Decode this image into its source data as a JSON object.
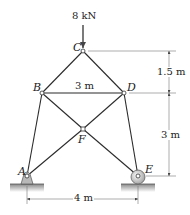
{
  "diagram": {
    "type": "truss",
    "load": {
      "label": "8 kN",
      "at_node": "C",
      "direction": "down"
    },
    "nodes": [
      {
        "id": "A",
        "label": "A",
        "x": 27,
        "y": 176,
        "support": "pin"
      },
      {
        "id": "B",
        "label": "B",
        "x": 42,
        "y": 93
      },
      {
        "id": "C",
        "label": "C",
        "x": 83,
        "y": 51
      },
      {
        "id": "D",
        "label": "D",
        "x": 124,
        "y": 93
      },
      {
        "id": "E",
        "label": "E",
        "x": 138,
        "y": 176,
        "support": "roller"
      },
      {
        "id": "F",
        "label": "F",
        "x": 83,
        "y": 129
      }
    ],
    "members": [
      [
        "A",
        "B"
      ],
      [
        "B",
        "C"
      ],
      [
        "C",
        "D"
      ],
      [
        "B",
        "D"
      ],
      [
        "D",
        "E"
      ],
      [
        "A",
        "F"
      ],
      [
        "F",
        "D"
      ],
      [
        "B",
        "F"
      ],
      [
        "F",
        "E"
      ]
    ],
    "dimensions": {
      "bd_width": "3 m",
      "upper_height": "1.5 m",
      "lower_height": "3 m",
      "base_width": "4 m"
    }
  }
}
